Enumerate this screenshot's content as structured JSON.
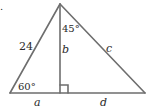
{
  "problem_marker": ".",
  "triangle": {
    "hypotenuse_left_label": "24",
    "apex_angle_label": "45°",
    "altitude_label": "b",
    "right_side_label": "c",
    "base_angle_label": "60°",
    "left_base_label": "a",
    "right_base_label": "d"
  },
  "colors": {
    "lines": "#6e6e6e",
    "text": "#2a2a2a"
  }
}
